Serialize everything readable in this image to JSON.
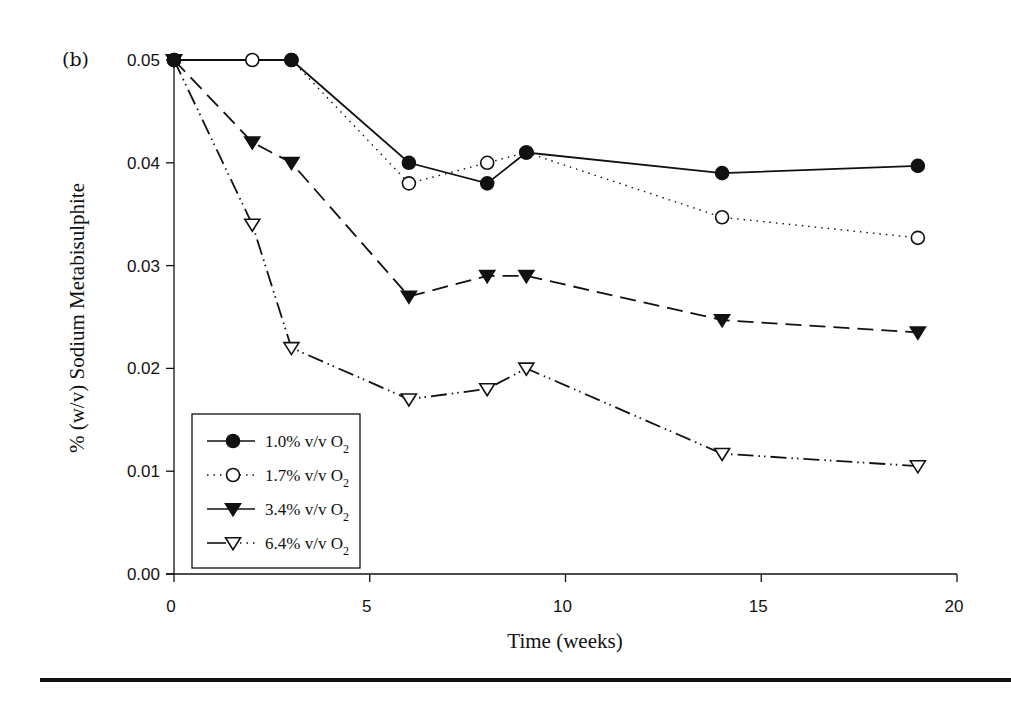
{
  "panel_label": "(b)",
  "chart_data": {
    "type": "line",
    "title": "",
    "xlabel": "Time (weeks)",
    "ylabel": "% (w/v) Sodium Metabisulphite",
    "xlim": [
      0,
      20
    ],
    "ylim": [
      0.0,
      0.05
    ],
    "x_ticks": [
      0,
      5,
      10,
      15,
      20
    ],
    "x_tick_labels": [
      "0",
      "5",
      "10",
      "15",
      "20"
    ],
    "y_ticks": [
      0.0,
      0.01,
      0.02,
      0.03,
      0.04,
      0.05
    ],
    "y_tick_labels": [
      "0.00",
      "0.01",
      "0.02",
      "0.03",
      "0.04",
      "0.05"
    ],
    "grid": false,
    "legend_position": "lower left",
    "series": [
      {
        "name": "1.0% v/v O2",
        "label_main": "1.0% v/v O",
        "label_sub": "2",
        "marker": "filled-circle",
        "line_style": "solid",
        "x": [
          0,
          3,
          6,
          8,
          9,
          14,
          19
        ],
        "values": [
          0.05,
          0.05,
          0.04,
          0.038,
          0.041,
          0.039,
          0.0397
        ]
      },
      {
        "name": "1.7% v/v O2",
        "label_main": "1.7% v/v O",
        "label_sub": "2",
        "marker": "open-circle",
        "line_style": "dotted",
        "x": [
          0,
          2,
          3,
          6,
          8,
          9,
          14,
          19
        ],
        "values": [
          0.05,
          0.05,
          0.05,
          0.038,
          0.04,
          0.041,
          0.0347,
          0.0327
        ]
      },
      {
        "name": "3.4% v/v O2",
        "label_main": "3.4% v/v O",
        "label_sub": "2",
        "marker": "filled-triangle-down",
        "line_style": "dashed",
        "x": [
          0,
          2,
          3,
          6,
          8,
          9,
          14,
          19
        ],
        "values": [
          0.05,
          0.042,
          0.04,
          0.027,
          0.029,
          0.029,
          0.0247,
          0.0235
        ]
      },
      {
        "name": "6.4% v/v O2",
        "label_main": "6.4% v/v O",
        "label_sub": "2",
        "marker": "open-triangle-down",
        "line_style": "dash-dot-dot",
        "x": [
          0,
          2,
          3,
          6,
          8,
          9,
          14,
          19
        ],
        "values": [
          0.05,
          0.034,
          0.022,
          0.017,
          0.018,
          0.02,
          0.0117,
          0.0105
        ]
      }
    ]
  },
  "colors": {
    "ink": "#111111",
    "background": "#ffffff"
  }
}
